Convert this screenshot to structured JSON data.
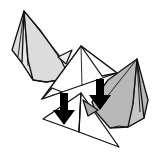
{
  "diagram": {
    "type": "origami-assembly-step",
    "colors": {
      "background": "#ffffff",
      "outline": "#111111",
      "left_unit_fill": "#dcdcdc",
      "right_unit_fill": "#b8b8b8",
      "paper_white": "#ffffff",
      "arrow": "#000000"
    },
    "elements": [
      {
        "name": "left-pyramid-unit",
        "shade": "light gray"
      },
      {
        "name": "right-pyramid-unit",
        "shade": "medium gray"
      },
      {
        "name": "top-triangle-unit",
        "shade": "white"
      },
      {
        "name": "bottom-triangle-unit",
        "shade": "white"
      },
      {
        "name": "arrow-left",
        "direction": "down"
      },
      {
        "name": "arrow-right",
        "direction": "down"
      }
    ]
  }
}
